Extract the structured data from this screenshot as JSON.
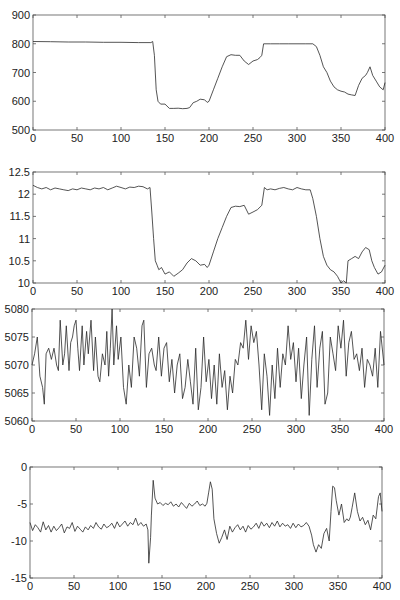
{
  "chart_data": [
    {
      "type": "line",
      "title": "",
      "xlabel": "",
      "ylabel": "",
      "xlim": [
        0,
        400
      ],
      "ylim": [
        500,
        900
      ],
      "xticks": [
        0,
        50,
        100,
        150,
        200,
        250,
        300,
        350,
        400
      ],
      "yticks": [
        500,
        600,
        700,
        800,
        900
      ],
      "grid": false,
      "frame": {
        "left": 33,
        "right": 385,
        "top": 15,
        "bottom": 130
      },
      "series": [
        {
          "name": "panel1",
          "x": [
            0,
            20,
            40,
            60,
            80,
            100,
            120,
            134,
            136,
            138,
            140,
            142,
            145,
            150,
            155,
            160,
            165,
            170,
            175,
            178,
            182,
            186,
            190,
            195,
            198,
            200,
            205,
            210,
            215,
            220,
            225,
            230,
            235,
            240,
            245,
            250,
            255,
            258,
            260,
            262,
            270,
            280,
            290,
            300,
            310,
            318,
            322,
            326,
            330,
            334,
            338,
            342,
            346,
            350,
            354,
            358,
            362,
            366,
            370,
            374,
            378,
            380,
            383,
            386,
            390,
            394,
            398,
            400
          ],
          "values": [
            808,
            807,
            806,
            806,
            805,
            805,
            804,
            804,
            808,
            760,
            640,
            600,
            590,
            590,
            575,
            575,
            576,
            574,
            575,
            578,
            595,
            600,
            607,
            605,
            596,
            600,
            640,
            680,
            720,
            755,
            762,
            760,
            760,
            740,
            728,
            740,
            745,
            752,
            760,
            800,
            800,
            800,
            800,
            800,
            800,
            800,
            790,
            760,
            720,
            700,
            670,
            650,
            640,
            635,
            632,
            625,
            622,
            620,
            655,
            680,
            690,
            700,
            720,
            690,
            670,
            650,
            640,
            665
          ]
        }
      ]
    },
    {
      "type": "line",
      "title": "",
      "xlabel": "",
      "ylabel": "",
      "xlim": [
        0,
        400
      ],
      "ylim": [
        10,
        12.5
      ],
      "xticks": [
        0,
        50,
        100,
        150,
        200,
        250,
        300,
        350,
        400
      ],
      "yticks": [
        10,
        10.5,
        11,
        11.5,
        12,
        12.5
      ],
      "grid": false,
      "frame": {
        "left": 33,
        "right": 385,
        "top": 172,
        "bottom": 283
      },
      "series": [
        {
          "name": "panel2",
          "x": [
            0,
            5,
            10,
            15,
            20,
            25,
            30,
            35,
            40,
            45,
            50,
            55,
            60,
            65,
            70,
            75,
            80,
            85,
            90,
            95,
            100,
            105,
            110,
            115,
            120,
            125,
            130,
            133,
            135,
            137,
            139,
            141,
            143,
            146,
            150,
            155,
            160,
            165,
            170,
            175,
            180,
            185,
            190,
            195,
            198,
            200,
            205,
            210,
            215,
            220,
            225,
            230,
            235,
            240,
            245,
            250,
            255,
            260,
            263,
            266,
            270,
            275,
            280,
            285,
            290,
            295,
            300,
            305,
            310,
            315,
            318,
            322,
            326,
            330,
            334,
            338,
            342,
            346,
            350,
            353,
            356,
            358,
            362,
            366,
            370,
            374,
            378,
            382,
            385,
            388,
            392,
            396,
            400
          ],
          "values": [
            12.2,
            12.15,
            12.12,
            12.15,
            12.1,
            12.14,
            12.12,
            12.1,
            12.08,
            12.12,
            12.1,
            12.14,
            12.12,
            12.1,
            12.14,
            12.12,
            12.15,
            12.1,
            12.14,
            12.18,
            12.15,
            12.12,
            12.16,
            12.15,
            12.18,
            12.17,
            12.12,
            12.15,
            11.6,
            11.0,
            10.5,
            10.4,
            10.3,
            10.35,
            10.2,
            10.25,
            10.15,
            10.22,
            10.3,
            10.45,
            10.55,
            10.5,
            10.4,
            10.42,
            10.35,
            10.4,
            10.7,
            11.0,
            11.25,
            11.5,
            11.7,
            11.73,
            11.72,
            11.75,
            11.55,
            11.6,
            11.65,
            11.75,
            12.15,
            12.1,
            12.12,
            12.1,
            12.13,
            12.15,
            12.12,
            12.1,
            12.15,
            12.12,
            12.1,
            12.1,
            11.9,
            11.5,
            11.0,
            10.6,
            10.4,
            10.3,
            10.25,
            10.15,
            10.0,
            10.05,
            10.0,
            10.5,
            10.55,
            10.6,
            10.55,
            10.7,
            10.8,
            10.75,
            10.5,
            10.35,
            10.2,
            10.25,
            10.4
          ]
        }
      ]
    },
    {
      "type": "line",
      "title": "",
      "xlabel": "",
      "ylabel": "",
      "xlim": [
        0,
        400
      ],
      "ylim": [
        5060,
        5080
      ],
      "xticks": [
        0,
        50,
        100,
        150,
        200,
        250,
        300,
        350,
        400
      ],
      "yticks": [
        5060,
        5065,
        5070,
        5075,
        5080
      ],
      "grid": false,
      "frame": {
        "left": 32,
        "right": 384,
        "top": 309,
        "bottom": 421
      },
      "series": [
        {
          "name": "panel3",
          "x": [
            0,
            3,
            6,
            9,
            12,
            14,
            16,
            19,
            22,
            25,
            28,
            30,
            32,
            35,
            37,
            39,
            42,
            44,
            46,
            48,
            50,
            52,
            54,
            57,
            59,
            62,
            64,
            67,
            70,
            72,
            75,
            77,
            80,
            83,
            85,
            87,
            89,
            91,
            93,
            96,
            98,
            101,
            104,
            107,
            110,
            113,
            116,
            119,
            122,
            125,
            127,
            130,
            133,
            136,
            139,
            141,
            144,
            147,
            150,
            153,
            156,
            159,
            162,
            165,
            168,
            171,
            174,
            177,
            180,
            183,
            186,
            189,
            192,
            195,
            198,
            201,
            204,
            207,
            210,
            213,
            216,
            219,
            222,
            225,
            228,
            231,
            234,
            237,
            240,
            243,
            246,
            249,
            252,
            255,
            258,
            261,
            264,
            267,
            270,
            273,
            276,
            279,
            282,
            285,
            288,
            291,
            294,
            297,
            300,
            303,
            306,
            309,
            312,
            315,
            318,
            321,
            324,
            327,
            330,
            333,
            336,
            339,
            342,
            345,
            348,
            351,
            354,
            357,
            360,
            363,
            366,
            369,
            372,
            375,
            378,
            381,
            384,
            387,
            390,
            393,
            396,
            400
          ],
          "values": [
            5070,
            5072,
            5075,
            5068,
            5066,
            5063,
            5072,
            5073,
            5071,
            5073,
            5070,
            5069,
            5078,
            5070,
            5072,
            5077,
            5069,
            5074,
            5075,
            5077,
            5078,
            5073,
            5069,
            5077,
            5070,
            5076,
            5072,
            5078,
            5069,
            5075,
            5068,
            5067,
            5072,
            5070,
            5076,
            5068,
            5073,
            5080,
            5070,
            5077,
            5071,
            5075,
            5066,
            5063,
            5070,
            5066,
            5075,
            5073,
            5068,
            5077,
            5078,
            5066,
            5072,
            5073,
            5070,
            5069,
            5075,
            5068,
            5073,
            5074,
            5067,
            5071,
            5065,
            5070,
            5072,
            5064,
            5066,
            5071,
            5067,
            5063,
            5073,
            5062,
            5066,
            5075,
            5067,
            5071,
            5064,
            5070,
            5063,
            5072,
            5066,
            5069,
            5062,
            5068,
            5065,
            5071,
            5070,
            5074,
            5073,
            5078,
            5071,
            5077,
            5074,
            5076,
            5070,
            5062,
            5072,
            5068,
            5061,
            5070,
            5064,
            5073,
            5066,
            5072,
            5070,
            5077,
            5071,
            5074,
            5067,
            5073,
            5064,
            5070,
            5075,
            5061,
            5071,
            5077,
            5066,
            5073,
            5076,
            5063,
            5065,
            5075,
            5072,
            5069,
            5077,
            5073,
            5078,
            5068,
            5074,
            5076,
            5071,
            5072,
            5069,
            5073,
            5066,
            5071,
            5070,
            5068,
            5073,
            5066,
            5076,
            5070,
            5064
          ]
        }
      ]
    },
    {
      "type": "line",
      "title": "",
      "xlabel": "",
      "ylabel": "",
      "xlim": [
        0,
        400
      ],
      "ylim": [
        -15,
        0
      ],
      "xticks": [
        0,
        50,
        100,
        150,
        200,
        250,
        300,
        350,
        400
      ],
      "yticks": [
        -15,
        -10,
        -5,
        0
      ],
      "grid": false,
      "frame": {
        "left": 30,
        "right": 382,
        "top": 467,
        "bottom": 578
      },
      "series": [
        {
          "name": "panel4",
          "x": [
            0,
            3,
            6,
            9,
            12,
            15,
            18,
            21,
            24,
            27,
            30,
            33,
            36,
            39,
            42,
            45,
            48,
            51,
            54,
            57,
            60,
            63,
            66,
            69,
            72,
            75,
            78,
            81,
            84,
            87,
            90,
            93,
            96,
            99,
            102,
            105,
            108,
            111,
            114,
            117,
            120,
            123,
            126,
            129,
            132,
            134,
            135,
            137,
            138,
            140,
            142,
            145,
            148,
            151,
            154,
            157,
            160,
            163,
            166,
            169,
            172,
            175,
            178,
            181,
            184,
            187,
            190,
            193,
            196,
            199,
            201,
            203,
            205,
            207,
            209,
            212,
            215,
            218,
            221,
            224,
            227,
            230,
            233,
            236,
            239,
            242,
            245,
            248,
            251,
            254,
            257,
            260,
            263,
            266,
            269,
            272,
            275,
            278,
            281,
            284,
            287,
            290,
            293,
            296,
            299,
            302,
            305,
            308,
            311,
            314,
            317,
            320,
            322,
            325,
            328,
            331,
            334,
            337,
            340,
            342,
            344,
            346,
            348,
            351,
            354,
            357,
            360,
            362,
            364,
            366,
            369,
            372,
            375,
            378,
            381,
            384,
            387,
            390,
            393,
            396,
            398,
            400
          ],
          "values": [
            -7.5,
            -8.6,
            -7.8,
            -8.2,
            -8.8,
            -7.4,
            -8.5,
            -7.9,
            -8.8,
            -8.0,
            -8.6,
            -8.2,
            -7.7,
            -8.9,
            -8.1,
            -8.3,
            -7.5,
            -8.7,
            -8.0,
            -8.4,
            -8.8,
            -8.1,
            -8.5,
            -7.9,
            -8.3,
            -7.5,
            -8.1,
            -8.4,
            -7.7,
            -8.2,
            -8.0,
            -7.6,
            -8.3,
            -7.4,
            -8.1,
            -7.7,
            -7.3,
            -8.0,
            -7.5,
            -7.8,
            -6.9,
            -7.9,
            -7.5,
            -8.0,
            -7.7,
            -8.5,
            -13.0,
            -9.5,
            -6.5,
            -1.8,
            -4.2,
            -5.0,
            -4.8,
            -5.2,
            -4.9,
            -5.1,
            -4.7,
            -5.3,
            -5.0,
            -5.4,
            -4.8,
            -5.2,
            -5.6,
            -4.9,
            -5.3,
            -5.0,
            -4.6,
            -5.2,
            -5.0,
            -5.3,
            -4.9,
            -3.5,
            -2.0,
            -3.0,
            -7.0,
            -9.0,
            -10.3,
            -9.5,
            -8.5,
            -9.8,
            -8.0,
            -8.8,
            -8.2,
            -7.8,
            -8.5,
            -8.0,
            -8.8,
            -7.9,
            -8.4,
            -8.1,
            -7.6,
            -8.3,
            -7.4,
            -8.0,
            -7.6,
            -8.2,
            -7.5,
            -8.0,
            -7.3,
            -8.1,
            -7.6,
            -8.0,
            -7.8,
            -8.3,
            -7.6,
            -8.2,
            -7.7,
            -8.1,
            -7.9,
            -7.5,
            -8.0,
            -9.2,
            -10.5,
            -11.5,
            -10.5,
            -11.0,
            -9.0,
            -8.3,
            -10.0,
            -6.0,
            -2.6,
            -2.8,
            -4.5,
            -6.5,
            -5.0,
            -7.5,
            -7.0,
            -7.3,
            -6.8,
            -5.5,
            -3.5,
            -6.0,
            -7.3,
            -6.8,
            -7.8,
            -7.2,
            -8.5,
            -6.5,
            -7.0,
            -4.0,
            -3.5,
            -6.0,
            -5.0
          ]
        }
      ]
    }
  ],
  "axis_labels": {
    "x_ticks": [
      "0",
      "50",
      "100",
      "150",
      "200",
      "250",
      "300",
      "350",
      "400"
    ],
    "panel1_y_ticks": [
      "500",
      "600",
      "700",
      "800",
      "900"
    ],
    "panel2_y_ticks": [
      "10",
      "10.5",
      "11",
      "11.5",
      "12",
      "12.5"
    ],
    "panel3_y_ticks": [
      "5060",
      "5065",
      "5070",
      "5075",
      "5080"
    ],
    "panel4_y_ticks": [
      "-15",
      "-10",
      "-5",
      "0"
    ]
  },
  "colors": {
    "line": "#2a2a2a",
    "axes": "#555555",
    "background": "#ffffff"
  }
}
